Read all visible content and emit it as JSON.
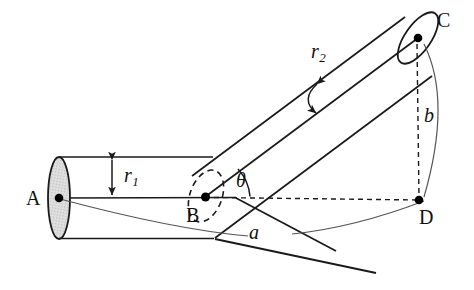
{
  "figure": {
    "type": "bent-cylinder-geometry-diagram",
    "background_color": "#ffffff",
    "line_color": "#1a1a1a",
    "dash_color": "#1a1a1a",
    "ellipse_fill_color": "#d9d9d9",
    "point_color": "#000000"
  },
  "labels": {
    "point_a": "A",
    "point_b": "B",
    "point_c": "C",
    "point_d": "D",
    "radius_1": "r",
    "radius_1_sub": "1",
    "radius_2": "r",
    "radius_2_sub": "2",
    "angle_theta": "θ",
    "arc_a": "a",
    "arc_b": "b"
  },
  "geometry": {
    "point_a": {
      "x": 59,
      "y": 198
    },
    "point_b": {
      "x": 205,
      "y": 197
    },
    "point_c": {
      "x": 418,
      "y": 38
    },
    "point_d": {
      "x": 419,
      "y": 200
    },
    "cylinder_1": {
      "top_edge_y": 157,
      "bottom_edge_y": 238,
      "axis_y": 198,
      "cap_center": {
        "x": 59,
        "y": 198
      },
      "cap_rx": 11,
      "cap_ry": 41
    },
    "cylinder_2": {
      "axis_start": {
        "x": 205,
        "y": 197
      },
      "axis_end": {
        "x": 418,
        "y": 38
      },
      "cap_center": {
        "x": 418,
        "y": 38
      },
      "cap_rx": 13,
      "cap_ry": 30,
      "cap_rotation_deg": 35
    },
    "joint_ellipse": {
      "center": {
        "x": 206,
        "y": 196
      },
      "rx": 16,
      "ry": 27,
      "rotation_deg": 20
    }
  }
}
